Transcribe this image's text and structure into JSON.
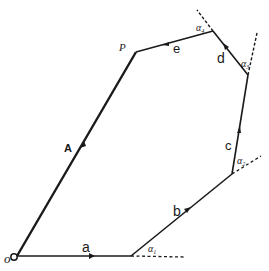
{
  "diagram": {
    "type": "vector polygon (closed sum of vectors)",
    "vertices": {
      "O": [
        17,
        256
      ],
      "V1": [
        131,
        256
      ],
      "V2": [
        232,
        174
      ],
      "V3": [
        248,
        75
      ],
      "V4": [
        213,
        31
      ],
      "P": [
        136,
        52
      ]
    },
    "labels": {
      "origin": "o",
      "point_p": "P",
      "resultant": "A",
      "a": "a",
      "b": "b",
      "c": "c",
      "d": "d",
      "e": "e",
      "alpha1": "α",
      "alpha1_sub": "1",
      "alpha2": "α",
      "alpha2_sub": "2",
      "alpha3": "α",
      "alpha3_sub": "3",
      "alpha4": "α",
      "alpha4_sub": "4"
    },
    "colors": {
      "line": "#1a1a1a",
      "background": "#ffffff"
    }
  }
}
